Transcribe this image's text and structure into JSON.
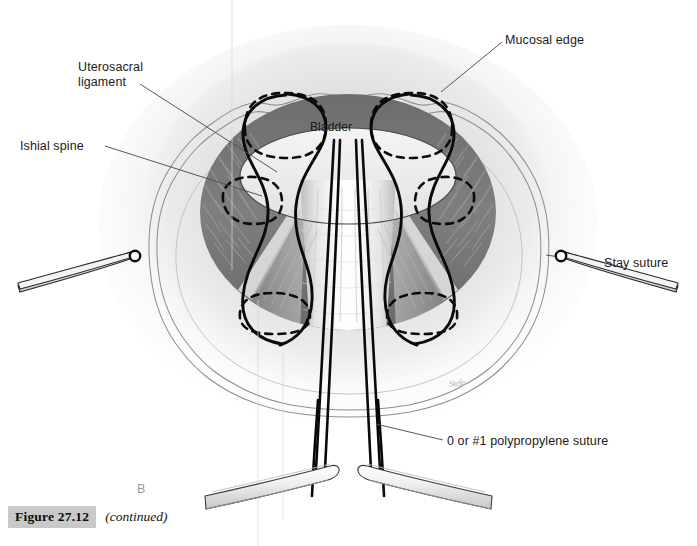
{
  "figure": {
    "panel_letter": "B",
    "caption_number": "Figure 27.12",
    "caption_continued": "(continued)",
    "artist_signature": "Stefa"
  },
  "annotations": [
    {
      "name": "mucosal-edge",
      "text": "Mucosal edge"
    },
    {
      "name": "uterosacral",
      "text": "Uterosacral\nligament"
    },
    {
      "name": "ishial-spine",
      "text": "Ishial spine"
    },
    {
      "name": "bladder",
      "text": "Bladder"
    },
    {
      "name": "stay-suture",
      "text": "Stay suture"
    },
    {
      "name": "polypropylene",
      "text": "0 or #1 polypropylene suture"
    }
  ],
  "labels": {
    "mucosal_edge": "Mucosal edge",
    "uterosacral_ligament": "Uterosacral\nligament",
    "ishial_spine": "Ishial spine",
    "bladder": "Bladder",
    "stay_suture": "Stay suture",
    "polypropylene_suture": "0 or #1 polypropylene suture"
  },
  "colors": {
    "background": "#ffffff",
    "tissue_light": "#e8e8e8",
    "tissue_mid": "#cfcfcf",
    "ring_dark": "#7b7b7b",
    "ring_darker": "#6a6a6a",
    "suture_black": "#0a0a0a",
    "leader_line": "#5a5a5a",
    "caption_box": "#c9c9c9",
    "panel_letter": "#9a9a9a",
    "instrument_outline": "#2b2b2b"
  }
}
